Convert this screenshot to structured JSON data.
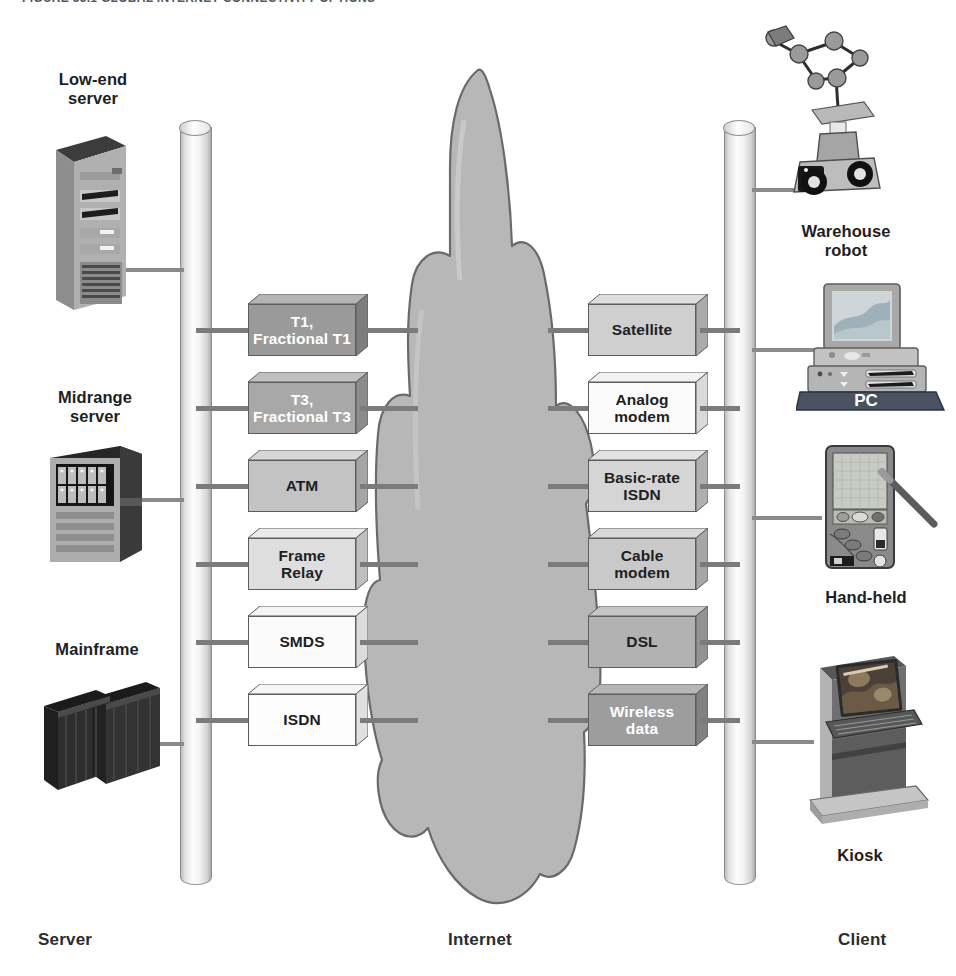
{
  "figure": {
    "caption_clipped": "FIGURE 33.1  GLOBAL INTERNET CONNECTIVITY OPTIONS"
  },
  "axis_labels": {
    "left": "Server",
    "center": "Internet",
    "right": "Client"
  },
  "colors": {
    "wire": "#7b7b7b",
    "box_outline": "#5d5d5d",
    "cloud_fill": "#b7b7b7",
    "cloud_outline": "#6a6a6a",
    "text_dark": "#1e1e24",
    "text_light": "#ffffff",
    "bus_light": "#fdfdfd"
  },
  "server_devices": [
    {
      "label": "Low-end\nserver",
      "label_line1": "Low-end",
      "label_line2": "server",
      "icon": "tower-server-icon"
    },
    {
      "label": "Midrange\nserver",
      "label_line1": "Midrange",
      "label_line2": "server",
      "icon": "rack-server-icon"
    },
    {
      "label": "Mainframe",
      "label_line1": "Mainframe",
      "label_line2": "",
      "icon": "mainframe-icon"
    }
  ],
  "client_devices": [
    {
      "label_line1": "Warehouse",
      "label_line2": "robot",
      "icon": "warehouse-robot-icon"
    },
    {
      "label_line1": "PC",
      "label_line2": "",
      "icon": "desktop-pc-icon",
      "inline_label": "PC"
    },
    {
      "label_line1": "Hand-held",
      "label_line2": "",
      "icon": "handheld-pda-icon"
    },
    {
      "label_line1": "Kiosk",
      "label_line2": "",
      "icon": "kiosk-icon"
    }
  ],
  "server_links": [
    {
      "id": "t1",
      "line1": "T1,",
      "line2": "Fractional T1",
      "fill": "#9a9a9a",
      "top": "#b4b4b4",
      "side": "#7d7d7d",
      "text": "#ffffff"
    },
    {
      "id": "t3",
      "line1": "T3,",
      "line2": "Fractional T3",
      "fill": "#a8a8a8",
      "top": "#c0c0c0",
      "side": "#8b8b8b",
      "text": "#ffffff"
    },
    {
      "id": "atm",
      "line1": "ATM",
      "line2": "",
      "fill": "#c3c3c3",
      "top": "#d6d6d6",
      "side": "#a5a5a5",
      "text": "#1e1e24"
    },
    {
      "id": "frame",
      "line1": "Frame",
      "line2": "Relay",
      "fill": "#dedede",
      "top": "#ebebeb",
      "side": "#bfbfbf",
      "text": "#1e1e24"
    },
    {
      "id": "smds",
      "line1": "SMDS",
      "line2": "",
      "fill": "#fbfbfb",
      "top": "#f4f4f4",
      "side": "#dcdcdc",
      "text": "#1e1e24"
    },
    {
      "id": "isdn",
      "line1": "ISDN",
      "line2": "",
      "fill": "#fdfdfd",
      "top": "#f6f6f6",
      "side": "#e0e0e0",
      "text": "#1e1e24"
    }
  ],
  "client_links": [
    {
      "id": "satellite",
      "line1": "Satellite",
      "line2": "",
      "fill": "#cfcfcf",
      "top": "#dedede",
      "side": "#ababab",
      "text": "#1e1e24"
    },
    {
      "id": "analog",
      "line1": "Analog",
      "line2": "modem",
      "fill": "#fbfbfb",
      "top": "#f2f2f2",
      "side": "#d9d9d9",
      "text": "#1e1e24"
    },
    {
      "id": "bri-isdn",
      "line1": "Basic-rate",
      "line2": "ISDN",
      "fill": "#d5d5d5",
      "top": "#e2e2e2",
      "side": "#b0b0b0",
      "text": "#1e1e24"
    },
    {
      "id": "cable",
      "line1": "Cable",
      "line2": "modem",
      "fill": "#c9c9c9",
      "top": "#d9d9d9",
      "side": "#a6a6a6",
      "text": "#1e1e24"
    },
    {
      "id": "dsl",
      "line1": "DSL",
      "line2": "",
      "fill": "#b2b2b2",
      "top": "#c6c6c6",
      "side": "#939393",
      "text": "#1e1e24"
    },
    {
      "id": "wireless",
      "line1": "Wireless",
      "line2": "data",
      "fill": "#9d9d9d",
      "top": "#b6b6b6",
      "side": "#818181",
      "text": "#ffffff"
    }
  ],
  "cloud": {
    "name": "internet-cloud",
    "label": "Internet"
  }
}
